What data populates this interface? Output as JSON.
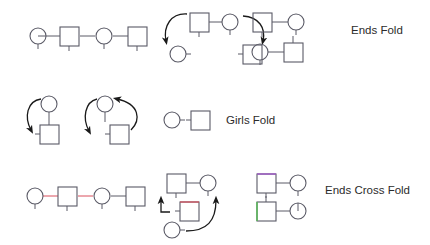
{
  "figure": {
    "type": "dance-call-diagram",
    "background_color": "#ffffff",
    "shape_stroke_color": "#5a5a66",
    "arrow_color": "#1a1a1a",
    "text_color": "#2b2b2b",
    "accent_red": "#d94f5c",
    "accent_purple": "#a05ac8",
    "accent_green": "#5cb85c",
    "shape_legend": {
      "circle": "dancer-circle",
      "square": "dancer-square",
      "stem": "dancer-facing-stem"
    }
  },
  "rows": [
    {
      "id": "row-ends-fold",
      "label": "Ends Fold",
      "groups": [
        {
          "id": "row1-group1",
          "kind": "line-of-four",
          "shapes": [
            "circle",
            "square",
            "circle",
            "square"
          ],
          "arrows": 0
        },
        {
          "id": "row1-group2",
          "kind": "fold-action",
          "shapes": [
            "square",
            "circle",
            "circle",
            "square"
          ],
          "arrows": 2
        },
        {
          "id": "row1-group3",
          "kind": "result-box",
          "shapes": [
            "square",
            "circle",
            "circle",
            "square"
          ],
          "arrows": 0
        }
      ]
    },
    {
      "id": "row-girls-fold",
      "label": "Girls Fold",
      "groups": [
        {
          "id": "row2-group1",
          "kind": "fold-action",
          "shapes": [
            "circle",
            "square"
          ],
          "arrows": 1
        },
        {
          "id": "row2-group2",
          "kind": "fold-action",
          "shapes": [
            "circle",
            "square"
          ],
          "arrows": 2
        },
        {
          "id": "row2-group3",
          "kind": "result-pair",
          "shapes": [
            "circle",
            "square"
          ],
          "arrows": 0
        }
      ]
    },
    {
      "id": "row-ends-cross-fold",
      "label": "Ends Cross Fold",
      "groups": [
        {
          "id": "row3-group1",
          "kind": "line-of-four",
          "shapes": [
            "circle",
            "square",
            "circle",
            "square"
          ],
          "arrows": 0
        },
        {
          "id": "row3-group2",
          "kind": "cross-fold-action",
          "shapes": [
            "square",
            "circle",
            "square",
            "circle"
          ],
          "arrows": 2
        },
        {
          "id": "row3-group3",
          "kind": "result-box",
          "shapes": [
            "square",
            "circle",
            "square",
            "circle"
          ],
          "arrows": 0
        }
      ]
    }
  ],
  "labels": {
    "ends_fold": "Ends Fold",
    "girls_fold": "Girls Fold",
    "ends_cross_fold": "Ends Cross Fold"
  }
}
